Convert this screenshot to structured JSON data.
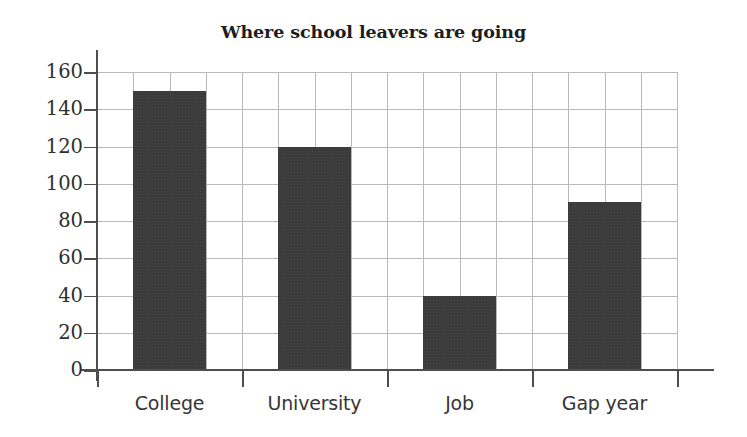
{
  "chart_data": {
    "type": "bar",
    "title": "Where school leavers are going",
    "xlabel": "",
    "ylabel": "",
    "categories": [
      "College",
      "University",
      "Job",
      "Gap year"
    ],
    "values": [
      150,
      120,
      40,
      90
    ],
    "ylim": [
      0,
      160
    ],
    "ytick_step": 20,
    "ytick_labels": [
      "0",
      "20",
      "40",
      "60",
      "80",
      "100",
      "120",
      "140",
      "160"
    ],
    "ytick_values": [
      0,
      20,
      40,
      60,
      80,
      100,
      120,
      140,
      160
    ],
    "grid": "both",
    "grid_vertical_count": 16,
    "legend": "none",
    "bar_color": "#3b3b3b",
    "grid_color": "#b9b9b9",
    "axis_color": "#4e4e4e",
    "background_color": "#ffffff",
    "text_color": "#303030"
  }
}
